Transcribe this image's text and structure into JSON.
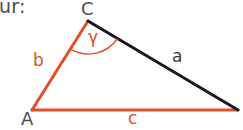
{
  "figure": {
    "type": "triangle-geometry-diagram",
    "caption_fragment": "ur:",
    "colors": {
      "accent_orange": "#e0502a",
      "side_a_black": "#1a1a1a",
      "text_gray": "#4d4d4d",
      "background": "#ffffff"
    },
    "vertices": [
      {
        "name": "C",
        "label": "C",
        "x": 88,
        "y": 21,
        "label_color": "#4d4d4d"
      },
      {
        "name": "A",
        "label": "A",
        "x": 32,
        "y": 110,
        "label_color": "#4d4d4d"
      },
      {
        "name": "B",
        "label": "",
        "x": 238,
        "y": 110,
        "label_color": "#4d4d4d"
      }
    ],
    "sides": [
      {
        "name": "b",
        "label": "b",
        "from": "A",
        "to": "C",
        "color": "#e0502a",
        "label_color": "#e0502a"
      },
      {
        "name": "c",
        "label": "c",
        "from": "A",
        "to": "B",
        "color": "#e0502a",
        "label_color": "#e0502a"
      },
      {
        "name": "a",
        "label": "a",
        "from": "C",
        "to": "B",
        "color": "#1a1a1a",
        "label_color": "#3b3b3b"
      }
    ],
    "angles": [
      {
        "name": "gamma",
        "label": "γ",
        "at_vertex": "C",
        "color": "#e0502a",
        "marker": "arc"
      }
    ]
  }
}
